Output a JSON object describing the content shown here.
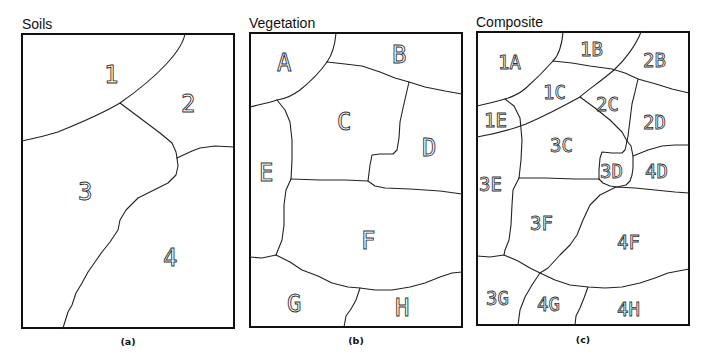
{
  "panels": [
    {
      "id": "a",
      "title": "Soils",
      "caption": "(a)",
      "zones": [
        "1",
        "2",
        "3",
        "4"
      ]
    },
    {
      "id": "b",
      "title": "Vegetation",
      "caption": "(b)",
      "zones": [
        "A",
        "B",
        "C",
        "D",
        "E",
        "F",
        "G",
        "H"
      ]
    },
    {
      "id": "c",
      "title": "Composite",
      "caption": "(c)",
      "zones": [
        "1A",
        "1B",
        "2B",
        "1C",
        "2C",
        "1E",
        "2D",
        "3C",
        "3D",
        "4D",
        "3E",
        "3F",
        "4F",
        "3G",
        "4G",
        "4H"
      ]
    }
  ]
}
